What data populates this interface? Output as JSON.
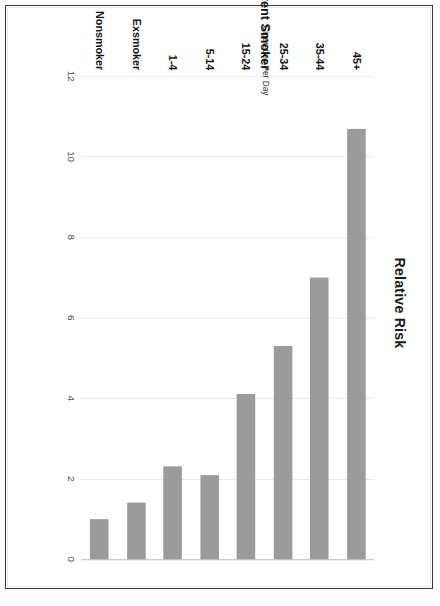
{
  "document": {
    "page_border_color": "#3a3a3a"
  },
  "chart_data": {
    "type": "bar",
    "orientation": "horizontal",
    "title": "Relative Risk",
    "xlabel": "",
    "ylabel": "",
    "categories": [
      "Nonsmoker",
      "Exsmoker",
      "1-4",
      "5-14",
      "15-24",
      "25-34",
      "35-44",
      "45+"
    ],
    "values": [
      1.0,
      1.4,
      2.3,
      2.1,
      4.1,
      5.3,
      7.0,
      10.7
    ],
    "tick_labels": [
      "0",
      "2",
      "4",
      "6",
      "8",
      "10",
      "12"
    ],
    "tick_values": [
      0,
      2,
      4,
      6,
      8,
      10,
      12
    ],
    "xlim": [
      0,
      12
    ],
    "axis_reversed": true,
    "grid": true,
    "legend": "none",
    "bar_color": "#9b9b9b",
    "grid_color": "#e9e9ec",
    "group_labels": [
      {
        "text": "Cigarettes Per Day",
        "covers": [
          "1-4",
          "5-14",
          "15-24",
          "25-34",
          "35-44",
          "45+"
        ]
      },
      {
        "text": "Current Smoker",
        "covers": [
          "1-4",
          "5-14",
          "15-24",
          "25-34",
          "35-44",
          "45+"
        ]
      }
    ],
    "annotations": []
  }
}
